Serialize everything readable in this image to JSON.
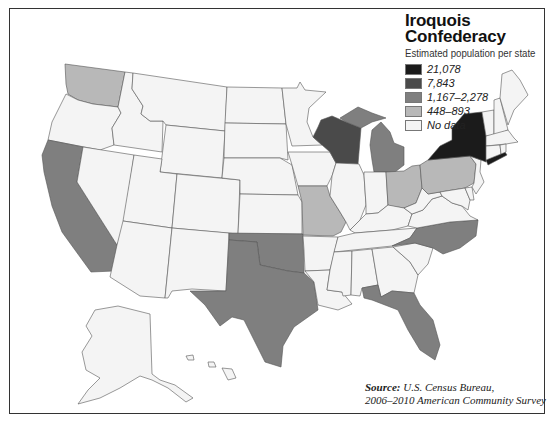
{
  "legend": {
    "title_line1": "Iroquois",
    "title_line2": "Confederacy",
    "subtitle": "Estimated population per state",
    "items": [
      {
        "label": "21,078",
        "color": "#1b1b1b"
      },
      {
        "label": "7,843",
        "color": "#4a4a4a"
      },
      {
        "label": "1,167–2,278",
        "color": "#7f7f7f"
      },
      {
        "label": "448–893",
        "color": "#b8b8b8"
      },
      {
        "label": "No data",
        "color": "#f4f4f4"
      }
    ]
  },
  "source": {
    "label": "Source:",
    "line1": "U.S. Census Bureau,",
    "line2": "2006–2010 American Community Survey"
  },
  "states": {
    "New York": "21,078",
    "Wisconsin": "7,843",
    "California": "1,167–2,278",
    "Texas": "1,167–2,278",
    "Oklahoma": "1,167–2,278",
    "Michigan": "1,167–2,278",
    "North Carolina": "1,167–2,278",
    "Florida": "1,167–2,278",
    "Washington": "448–893",
    "Missouri": "448–893",
    "Ohio": "448–893",
    "Pennsylvania": "448–893"
  },
  "colors": {
    "no_data": "#f4f4f4",
    "border": "#555555",
    "frame": "#333333"
  }
}
